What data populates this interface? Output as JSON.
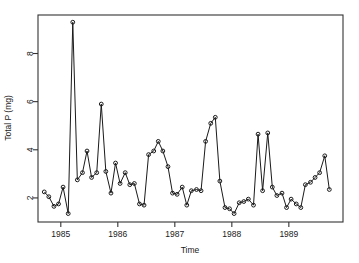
{
  "chart_data": {
    "type": "line",
    "title": "",
    "subtitle": "",
    "xlabel": "Time",
    "ylabel": "Total P (mg)",
    "xlim": [
      1984.6,
      1989.95
    ],
    "ylim": [
      1.0,
      9.6
    ],
    "grid": false,
    "legend": null,
    "marker": "open-circle",
    "line_color": "#1a1a1a",
    "marker_color": "#1a1a1a",
    "xticks": [
      1985,
      1986,
      1987,
      1988,
      1989
    ],
    "xtick_labels": [
      "1985",
      "1986",
      "1987",
      "1988",
      "1989"
    ],
    "yticks": [
      2,
      4,
      6,
      8
    ],
    "ytick_labels": [
      "2",
      "4",
      "6",
      "8"
    ],
    "series": [
      {
        "name": "Total P",
        "x": [
          1984.71,
          1984.79,
          1984.88,
          1984.96,
          1985.04,
          1985.13,
          1985.21,
          1985.29,
          1985.38,
          1985.46,
          1985.54,
          1985.63,
          1985.71,
          1985.79,
          1985.88,
          1985.96,
          1986.04,
          1986.13,
          1986.21,
          1986.29,
          1986.38,
          1986.46,
          1986.54,
          1986.63,
          1986.71,
          1986.79,
          1986.88,
          1986.96,
          1987.04,
          1987.13,
          1987.21,
          1987.29,
          1987.38,
          1987.46,
          1987.54,
          1987.63,
          1987.71,
          1987.79,
          1987.88,
          1987.96,
          1988.04,
          1988.13,
          1988.21,
          1988.29,
          1988.38,
          1988.46,
          1988.54,
          1988.63,
          1988.71,
          1988.79,
          1988.88,
          1988.96,
          1989.04,
          1989.13,
          1989.21,
          1989.29,
          1989.38,
          1989.46,
          1989.54,
          1989.63,
          1989.71
        ],
        "values": [
          2.25,
          2.05,
          1.65,
          1.75,
          2.45,
          1.35,
          9.3,
          2.75,
          3.05,
          3.95,
          2.85,
          3.05,
          5.9,
          3.1,
          2.2,
          3.45,
          2.6,
          3.05,
          2.55,
          2.6,
          1.75,
          1.7,
          3.8,
          3.95,
          4.35,
          3.95,
          3.3,
          2.2,
          2.15,
          2.45,
          1.7,
          2.3,
          2.35,
          2.3,
          4.35,
          5.1,
          5.35,
          2.7,
          1.6,
          1.55,
          1.35,
          1.8,
          1.85,
          1.95,
          1.7,
          4.65,
          2.3,
          4.7,
          2.45,
          2.1,
          2.2,
          1.6,
          1.95,
          1.75,
          1.6,
          2.55,
          2.65,
          2.85,
          3.05,
          3.75,
          2.35
        ]
      }
    ]
  },
  "plot_geometry": {
    "frame_left": 38,
    "frame_right": 343,
    "frame_top": 15,
    "frame_bottom": 222
  }
}
